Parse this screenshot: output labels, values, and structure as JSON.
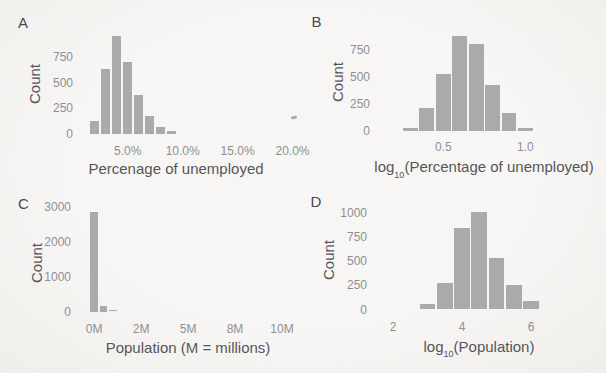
{
  "figure": {
    "bg_color": "#f4f3f0",
    "bar_color": "#aaa9ab",
    "axis_title_color": "#56565a",
    "tick_label_color": "#8f8f92",
    "panel_letter_color": "#4a4a4e"
  },
  "chart_data": [
    {
      "type": "bar",
      "panel_letter": "A",
      "title": "",
      "xlabel": "Percenage of unemployed",
      "xlabel_parts": {
        "pre": "Percenage of unemployed",
        "sub": "",
        "post": ""
      },
      "ylabel": "Count",
      "x": [
        2,
        3,
        4,
        5,
        6,
        7,
        8,
        9
      ],
      "values": [
        125,
        630,
        950,
        700,
        375,
        175,
        70,
        25
      ],
      "binwidth": 1,
      "xlim": [
        1.2,
        20.5
      ],
      "ylim": [
        0,
        1000
      ],
      "xticks": [
        {
          "v": 5,
          "label": "5.0%"
        },
        {
          "v": 10,
          "label": "10.0%"
        },
        {
          "v": 15,
          "label": "15.0%"
        },
        {
          "v": 20,
          "label": "20.0%"
        }
      ],
      "yticks": [
        {
          "v": 0,
          "label": "0"
        },
        {
          "v": 250,
          "label": "250"
        },
        {
          "v": 500,
          "label": "500"
        },
        {
          "v": 750,
          "label": "750"
        }
      ],
      "grid": false,
      "legend": null
    },
    {
      "type": "bar",
      "panel_letter": "B",
      "title": "",
      "xlabel": "log10(Percentage of unemployed)",
      "xlabel_parts": {
        "pre": "log",
        "sub": "10",
        "post": "(Percentage of unemployed)"
      },
      "ylabel": "Count",
      "x": [
        0.3,
        0.4,
        0.5,
        0.6,
        0.7,
        0.8,
        0.9,
        1.0
      ],
      "values": [
        30,
        215,
        530,
        880,
        810,
        425,
        165,
        25
      ],
      "binwidth": 0.1,
      "xlim": [
        0.17,
        1.46
      ],
      "ylim": [
        0,
        900
      ],
      "xticks": [
        {
          "v": 0.5,
          "label": "0.5"
        },
        {
          "v": 1.0,
          "label": "1.0"
        }
      ],
      "yticks": [
        {
          "v": 0,
          "label": "0"
        },
        {
          "v": 250,
          "label": "250"
        },
        {
          "v": 500,
          "label": "500"
        },
        {
          "v": 750,
          "label": "750"
        }
      ],
      "grid": false,
      "legend": null
    },
    {
      "type": "bar",
      "panel_letter": "C",
      "title": "",
      "xlabel": "Population (M = millions)",
      "xlabel_parts": {
        "pre": "Population (M = millions)",
        "sub": "",
        "post": ""
      },
      "ylabel": "Count",
      "x": [
        0,
        0.5,
        1.0
      ],
      "values": [
        2850,
        150,
        35
      ],
      "binwidth": 0.5,
      "xlim": [
        -0.43,
        10.85
      ],
      "ylim": [
        0,
        3000
      ],
      "xticks": [
        {
          "v": 0,
          "label": "0M"
        },
        {
          "v": 2.5,
          "label": "2M"
        },
        {
          "v": 5,
          "label": "5M"
        },
        {
          "v": 7.5,
          "label": "8M"
        },
        {
          "v": 10,
          "label": "10M"
        }
      ],
      "yticks": [
        {
          "v": 0,
          "label": "0"
        },
        {
          "v": 1000,
          "label": "1000"
        },
        {
          "v": 2000,
          "label": "2000"
        },
        {
          "v": 3000,
          "label": "3000"
        }
      ],
      "grid": false,
      "legend": null
    },
    {
      "type": "bar",
      "panel_letter": "D",
      "title": "",
      "xlabel": "log10(Population)",
      "xlabel_parts": {
        "pre": "log",
        "sub": "10",
        "post": "(Population)"
      },
      "ylabel": "Count",
      "x": [
        3,
        3.5,
        4,
        4.5,
        5,
        5.5,
        6
      ],
      "values": [
        60,
        275,
        850,
        1010,
        540,
        255,
        85
      ],
      "binwidth": 0.5,
      "xlim": [
        1.88,
        8.03
      ],
      "ylim": [
        0,
        1050
      ],
      "xticks": [
        {
          "v": 2,
          "label": "2"
        },
        {
          "v": 4,
          "label": "4"
        },
        {
          "v": 6,
          "label": "6"
        }
      ],
      "yticks": [
        {
          "v": 0,
          "label": "0"
        },
        {
          "v": 250,
          "label": "250"
        },
        {
          "v": 500,
          "label": "500"
        },
        {
          "v": 750,
          "label": "750"
        },
        {
          "v": 1000,
          "label": "1000"
        }
      ],
      "grid": false,
      "legend": null
    }
  ]
}
